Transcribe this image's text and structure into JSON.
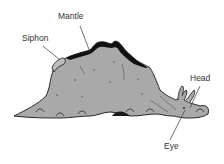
{
  "diagram": {
    "labels": {
      "mantle": "Mantle",
      "siphon": "Siphon",
      "head": "Head",
      "eye": "Eye"
    },
    "colors": {
      "body": "#a9a9a9",
      "mantle": "#111111",
      "outline": "#2a2a2a",
      "leader_line": "#333333",
      "text": "#333333",
      "background": "#ffffff"
    }
  }
}
